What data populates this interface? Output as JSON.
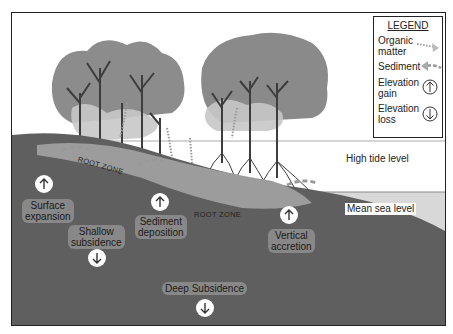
{
  "legend": {
    "title": "LEGEND",
    "items": [
      {
        "label_line1": "Organic",
        "label_line2": "matter",
        "symbol": "dotted-arrow-right-icon"
      },
      {
        "label_line1": "Sediment",
        "label_line2": "",
        "symbol": "dashed-arrow-left-icon"
      },
      {
        "label_line1": "Elevation",
        "label_line2": "gain",
        "symbol": "arrow-up-circle-icon"
      },
      {
        "label_line1": "Elevation",
        "label_line2": "loss",
        "symbol": "arrow-down-circle-icon"
      }
    ]
  },
  "levels": {
    "high_tide": "High tide level",
    "mean_sea": "Mean sea level"
  },
  "zones": {
    "root_zone_1": "ROOT ZONE",
    "root_zone_2": "ROOT ZONE"
  },
  "processes": [
    {
      "line1": "Surface",
      "line2": "expansion",
      "direction": "up"
    },
    {
      "line1": "Shallow",
      "line2": "subsidence",
      "direction": "down"
    },
    {
      "line1": "Sediment",
      "line2": "deposition",
      "direction": "up"
    },
    {
      "line1": "Vertical",
      "line2": "accretion",
      "direction": "up"
    },
    {
      "line1": "Deep Subsidence",
      "line2": "",
      "direction": "down"
    }
  ],
  "colors": {
    "soil": "#5e5e5e",
    "root_zone": "#9a9a9a",
    "canopy_dark": "#8a8a8a",
    "canopy_light": "#c4c4c4",
    "water": "#d6d6d6",
    "trunk": "#3a3a3a"
  }
}
